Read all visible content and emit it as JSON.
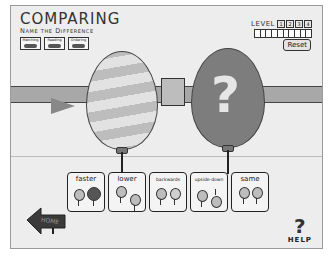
{
  "header": {
    "title": "COMPARING",
    "subtitle": "Name the Difference"
  },
  "mode_tabs": [
    {
      "label": "Matching",
      "icon": "balloons-pair-icon"
    },
    {
      "label": "Reading",
      "icon": "book-icon"
    },
    {
      "label": "Ordering",
      "icon": "order-icon"
    }
  ],
  "level": {
    "label": "LEVEL",
    "options": [
      "1",
      "2",
      "3",
      "4"
    ],
    "progress_slots": 10,
    "reset_label": "Reset"
  },
  "scene": {
    "left_balloon": "striped-balloon",
    "right_balloon": "mystery-balloon",
    "right_balloon_mark": "?"
  },
  "answer_cards": [
    {
      "label": "faster"
    },
    {
      "label": "lower"
    },
    {
      "label": "backwards"
    },
    {
      "label": "upside-down"
    },
    {
      "label": "same"
    }
  ],
  "navigation": {
    "home_label": "HOME",
    "help_label": "HELP",
    "help_mark": "?"
  },
  "colors": {
    "background": "#ededed",
    "outline": "#222222",
    "mystery_balloon": "#7d7d7d",
    "fence": "#a8a8a8"
  }
}
